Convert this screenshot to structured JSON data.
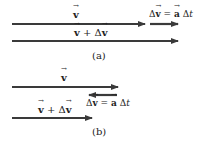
{
  "panel_a": {
    "caption": "(a)",
    "v_label": "v",
    "vdv_label_v": "v",
    "vdv_label_plus": " + Δ",
    "vdv_label_v2": "v",
    "dv_label_delta": "Δ",
    "dv_label_v": "v",
    "dv_label_eq": " = ",
    "dv_label_a": "a",
    "dv_label_dt": " Δ",
    "dv_label_t": "t"
  },
  "panel_b": {
    "caption": "(b)",
    "v_label": "v",
    "vdv_label_v": "v",
    "vdv_label_plus": " + Δ",
    "vdv_label_v2": "v",
    "dv_label_delta": "Δ",
    "dv_label_v": "v",
    "dv_label_eq": " = ",
    "dv_label_a": "a",
    "dv_label_dt": " Δ",
    "dv_label_t": "t"
  },
  "colors": {
    "arrow": "#3a3a3a",
    "background": "#ffffff"
  }
}
